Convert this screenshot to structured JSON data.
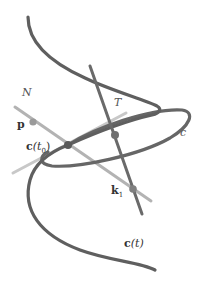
{
  "diagram": {
    "labels": {
      "N": "N",
      "T": "T",
      "p": "p",
      "c0_bold": "c",
      "c0_arg": "(t",
      "c0_sub": "0",
      "c0_close": ")",
      "circle": "c",
      "k1_bold": "k",
      "k1_sub": "1",
      "ct_bold": "c",
      "ct_arg": "(t)"
    },
    "colors": {
      "curve": "#5f5f5f",
      "normal_line": "#b3b3b3",
      "tangent_line": "#6a6a6a",
      "light_line": "#c8c8c8",
      "point": "#707070",
      "text": "#333333"
    },
    "points": [
      {
        "name": "p",
        "x": 33,
        "y": 122
      },
      {
        "name": "c(t0)",
        "x": 68,
        "y": 145
      },
      {
        "name": "center",
        "x": 115,
        "y": 135
      },
      {
        "name": "k1",
        "x": 133,
        "y": 189
      }
    ]
  }
}
